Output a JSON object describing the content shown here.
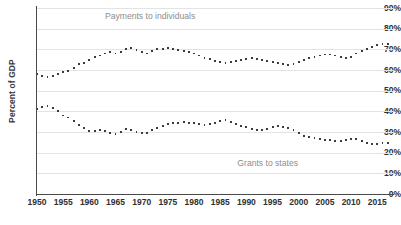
{
  "chart_data": {
    "type": "scatter",
    "title": "",
    "subtitle": "",
    "xlabel": "",
    "ylabel": "Percent of GDP",
    "xlim": [
      1950,
      2018
    ],
    "ylim": [
      0,
      90
    ],
    "grid": true,
    "legend_position": "inline-annotations",
    "y_tick_labels": [
      "90%",
      "80%",
      "70%",
      "60%",
      "50%",
      "40%",
      "30%",
      "20%",
      "10%",
      "0%"
    ],
    "y_tick_values": [
      90,
      80,
      70,
      60,
      50,
      40,
      30,
      20,
      10,
      0
    ],
    "x_tick_labels": [
      "1950",
      "1955",
      "1960",
      "1965",
      "1970",
      "1975",
      "1980",
      "1985",
      "1990",
      "1995",
      "2000",
      "2005",
      "2010",
      "2015"
    ],
    "x_tick_values": [
      1950,
      1955,
      1960,
      1965,
      1970,
      1975,
      1980,
      1985,
      1990,
      1995,
      2000,
      2005,
      2010,
      2015
    ],
    "series": [
      {
        "name": "Payments to individuals",
        "color": "#3b3b3b",
        "label_x": 1971,
        "label_y": 86,
        "x": [
          1950,
          1951,
          1952,
          1953,
          1954,
          1955,
          1956,
          1957,
          1958,
          1959,
          1960,
          1961,
          1962,
          1963,
          1964,
          1965,
          1966,
          1967,
          1968,
          1969,
          1970,
          1971,
          1972,
          1973,
          1974,
          1975,
          1976,
          1977,
          1978,
          1979,
          1980,
          1981,
          1982,
          1983,
          1984,
          1985,
          1986,
          1987,
          1988,
          1989,
          1990,
          1991,
          1992,
          1993,
          1994,
          1995,
          1996,
          1997,
          1998,
          1999,
          2000,
          2001,
          2002,
          2003,
          2004,
          2005,
          2006,
          2007,
          2008,
          2009,
          2010,
          2011,
          2012,
          2013,
          2014,
          2015,
          2016,
          2017
        ],
        "values": [
          58,
          57,
          56.5,
          57,
          58,
          59,
          59.5,
          61,
          63,
          63.5,
          65,
          66.5,
          67,
          68,
          68.5,
          68,
          68.5,
          70,
          70.5,
          69.5,
          68.5,
          68,
          69,
          70,
          70,
          70.5,
          70,
          69.5,
          69,
          68.5,
          68,
          67,
          66,
          65.5,
          64.5,
          64,
          63.5,
          64,
          64.5,
          65,
          65.5,
          66,
          65.5,
          65,
          64.5,
          64,
          63.5,
          63,
          62.5,
          63,
          64,
          65,
          66,
          66.5,
          67,
          67.5,
          67.5,
          67,
          66.5,
          66,
          66.5,
          68,
          69,
          70,
          71,
          72,
          72.5,
          72.5
        ]
      },
      {
        "name": "Grants to states",
        "color": "#3b3b3b",
        "label_x": 1994,
        "label_y": 15,
        "x": [
          1950,
          1951,
          1952,
          1953,
          1954,
          1955,
          1956,
          1957,
          1958,
          1959,
          1960,
          1961,
          1962,
          1963,
          1964,
          1965,
          1966,
          1967,
          1968,
          1969,
          1970,
          1971,
          1972,
          1973,
          1974,
          1975,
          1976,
          1977,
          1978,
          1979,
          1980,
          1981,
          1982,
          1983,
          1984,
          1985,
          1986,
          1987,
          1988,
          1989,
          1990,
          1991,
          1992,
          1993,
          1994,
          1995,
          1996,
          1997,
          1998,
          1999,
          2000,
          2001,
          2002,
          2003,
          2004,
          2005,
          2006,
          2007,
          2008,
          2009,
          2010,
          2011,
          2012,
          2013,
          2014,
          2015,
          2016,
          2017
        ],
        "values": [
          41,
          42,
          42.5,
          41.5,
          40,
          38,
          37,
          35.5,
          33.5,
          32,
          30.5,
          30.5,
          31,
          30.5,
          29.5,
          29,
          30,
          31.5,
          31,
          30,
          29.5,
          29.5,
          31,
          32,
          33,
          34,
          34.5,
          34.5,
          35,
          34.5,
          34.5,
          34,
          33.5,
          34,
          34.5,
          35.5,
          36,
          35,
          34,
          33,
          32.5,
          31.5,
          31,
          31,
          31.5,
          32.5,
          33,
          32.5,
          32,
          31,
          29.5,
          28,
          27.5,
          27,
          26.5,
          26,
          26,
          25.5,
          25.5,
          26,
          26.5,
          26.5,
          25.5,
          24.5,
          24,
          24,
          24.5,
          24.5
        ]
      }
    ]
  }
}
